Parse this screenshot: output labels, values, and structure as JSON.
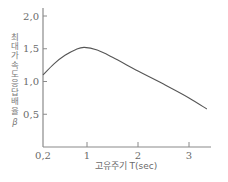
{
  "chart_data": {
    "type": "line",
    "title": "",
    "xlabel": "고유주기 T(sec)",
    "ylabel": "최대가속도응답배율 β",
    "ylabel_chars": [
      "최",
      "대",
      "가",
      "속",
      "도",
      "응",
      "답",
      "배",
      "율",
      "β"
    ],
    "xlim": [
      0.2,
      3.4
    ],
    "ylim": [
      0,
      2.15
    ],
    "x_ticks": [
      {
        "value": 0.2,
        "label": "0,2"
      },
      {
        "value": 1,
        "label": "1"
      },
      {
        "value": 2,
        "label": "2"
      },
      {
        "value": 3,
        "label": "3"
      }
    ],
    "y_ticks": [
      {
        "value": 0.5,
        "label": "0,5"
      },
      {
        "value": 1.0,
        "label": "1,0"
      },
      {
        "value": 1.5,
        "label": "1,5"
      },
      {
        "value": 2.0,
        "label": "2,0"
      }
    ],
    "grid": false,
    "legend": null,
    "series": [
      {
        "name": "β",
        "x": [
          0.2,
          0.4,
          0.6,
          0.8,
          0.95,
          1.2,
          1.5,
          2.0,
          2.5,
          3.0,
          3.35
        ],
        "y": [
          1.1,
          1.27,
          1.4,
          1.49,
          1.52,
          1.48,
          1.37,
          1.16,
          0.96,
          0.75,
          0.58
        ]
      }
    ],
    "colors": {
      "line": "#555555",
      "axis": "#8a8a8a",
      "text": "#6a6a6a"
    }
  }
}
